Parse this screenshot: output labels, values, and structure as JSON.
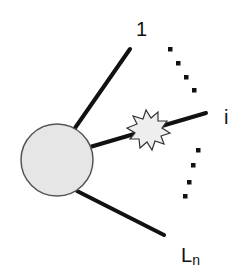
{
  "diagram": {
    "type": "feynman-like vertex diagram",
    "colors": {
      "line": "#111111",
      "blob_fill": "#e6e6e6",
      "blob_stroke": "#555555",
      "burst_fill": "#eeeeee",
      "burst_stroke": "#333333",
      "background": "#ffffff"
    },
    "blob": {
      "cx": 57,
      "cy": 160,
      "r": 36
    },
    "legs": [
      {
        "id": "leg-1",
        "label": "1",
        "x1": 75,
        "y1": 128,
        "x2": 130,
        "y2": 49
      },
      {
        "id": "leg-i",
        "label": "i",
        "x1": 90,
        "y1": 147,
        "x2": 206,
        "y2": 113,
        "marked": true
      },
      {
        "id": "leg-n",
        "label": "L",
        "subscript": "n",
        "x1": 77,
        "y1": 191,
        "x2": 164,
        "y2": 235
      }
    ],
    "labels": {
      "top": "1",
      "middle": "i",
      "bottom_main": "L",
      "bottom_sub": "n"
    },
    "ellipsis_upper": [
      [
        170,
        49
      ],
      [
        178,
        63
      ],
      [
        186,
        77
      ],
      [
        194,
        90
      ]
    ],
    "ellipsis_lower": [
      [
        198,
        150
      ],
      [
        193,
        165
      ],
      [
        189,
        182
      ],
      [
        185,
        196
      ]
    ],
    "burst": {
      "cx": 148,
      "cy": 129,
      "description": "starburst marker on leg i"
    }
  }
}
